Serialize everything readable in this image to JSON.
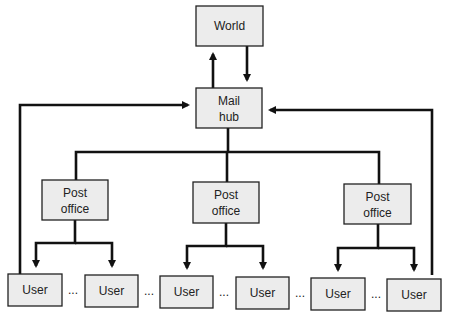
{
  "diagram": {
    "nodes": {
      "world": {
        "label": "World"
      },
      "mail_hub": {
        "line1": "Mail",
        "line2": "hub"
      },
      "post_offices": [
        {
          "line1": "Post",
          "line2": "office"
        },
        {
          "line1": "Post",
          "line2": "office"
        },
        {
          "line1": "Post",
          "line2": "office"
        }
      ],
      "users": [
        {
          "label": "User"
        },
        {
          "label": "User"
        },
        {
          "label": "User"
        },
        {
          "label": "User"
        },
        {
          "label": "User"
        },
        {
          "label": "User"
        }
      ]
    },
    "ellipsis": "...",
    "edges": [
      {
        "from": "mail_hub",
        "to": "world",
        "arrow": true
      },
      {
        "from": "world",
        "to": "mail_hub",
        "arrow": true
      },
      {
        "from": "mail_hub",
        "to": "post_offices",
        "arrow": false
      },
      {
        "from": "post_office_1",
        "to": "user_1",
        "arrow": true
      },
      {
        "from": "post_office_1",
        "to": "user_2",
        "arrow": true
      },
      {
        "from": "post_office_2",
        "to": "user_3",
        "arrow": true
      },
      {
        "from": "post_office_2",
        "to": "user_4",
        "arrow": true
      },
      {
        "from": "post_office_3",
        "to": "user_5",
        "arrow": true
      },
      {
        "from": "post_office_3",
        "to": "user_6",
        "arrow": true
      },
      {
        "from": "user_1",
        "to": "mail_hub",
        "arrow": true
      },
      {
        "from": "user_6",
        "to": "mail_hub",
        "arrow": true
      }
    ]
  }
}
